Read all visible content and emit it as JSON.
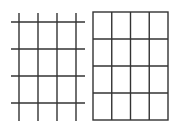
{
  "diagram": {
    "type": "grid-comparison",
    "stroke_color": "#333333",
    "left_grid": {
      "description": "Open grid of crossing lines (4 vertical, 4 horizontal)",
      "vertical_lines": 4,
      "horizontal_lines": 4
    },
    "right_grid": {
      "description": "Closed rectangular grid of 4 columns x 4 rows",
      "columns": 4,
      "rows": 4
    }
  }
}
